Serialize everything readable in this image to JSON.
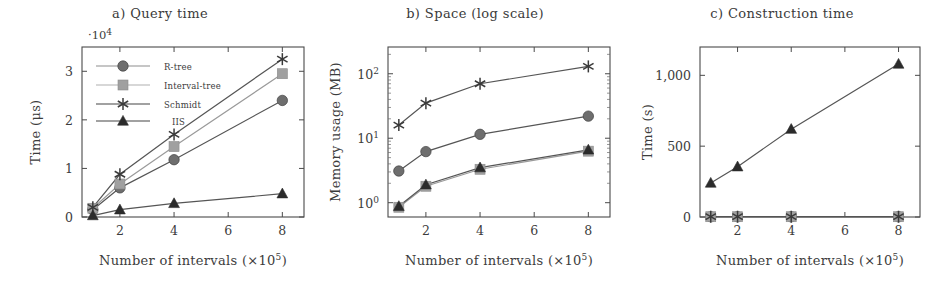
{
  "figure": {
    "panels": [
      "a",
      "b",
      "c"
    ],
    "shared_xlabel": "Number of intervals (×10⁵)",
    "xlabel_main": "Number of intervals (",
    "xlabel_mult": "×10",
    "xlabel_exp": "5",
    "xlabel_close": ")"
  },
  "series_style": {
    "r_tree_color": "#6e6e6e",
    "interval_tree_color": "#a0a0a0",
    "schmidt_color": "#3a3a3a",
    "iis_color": "#2b2b2b",
    "line_color": "#5a5a5a",
    "frame_color": "#4a4a4a",
    "text_color": "#3c3c3c"
  },
  "legend": {
    "entries": [
      {
        "label": "R-tree",
        "marker": "circle"
      },
      {
        "label": "Interval-tree",
        "marker": "square"
      },
      {
        "label": "Schmidt",
        "marker": "star"
      },
      {
        "label": "IIS",
        "marker": "triangle"
      }
    ]
  },
  "chart_data": [
    {
      "panel": "a",
      "type": "line",
      "title": "a) Query time",
      "xlabel": "Number of intervals (×10⁵)",
      "ylabel": "Time (μs)",
      "y_multiplier": "·10⁴",
      "y_mult_base": "·10",
      "y_mult_exp": "4",
      "x": [
        1,
        2,
        4,
        8
      ],
      "xticks": [
        2,
        4,
        6,
        8
      ],
      "xticklabels": [
        "2",
        "4",
        "6",
        "8"
      ],
      "xlim": [
        0.6,
        8.8
      ],
      "yticks": [
        0,
        1,
        2,
        3
      ],
      "yticklabels": [
        "0",
        "1",
        "2",
        "3"
      ],
      "ylim": [
        0,
        3.5
      ],
      "grid": false,
      "legend_position": "upper-left-inside",
      "series": [
        {
          "name": "R-tree",
          "marker": "circle",
          "values": [
            0.15,
            0.6,
            1.18,
            2.4
          ]
        },
        {
          "name": "Interval-tree",
          "marker": "square",
          "values": [
            0.18,
            0.68,
            1.45,
            2.95
          ]
        },
        {
          "name": "Schmidt",
          "marker": "star",
          "values": [
            0.2,
            0.88,
            1.7,
            3.25
          ]
        },
        {
          "name": "IIS",
          "marker": "triangle",
          "values": [
            0.03,
            0.15,
            0.28,
            0.48
          ]
        }
      ]
    },
    {
      "panel": "b",
      "type": "line",
      "title": "b) Space (log scale)",
      "xlabel": "Number of intervals (×10⁵)",
      "ylabel": "Memory usage (MB)",
      "yscale": "log",
      "x": [
        1,
        2,
        4,
        8
      ],
      "xticks": [
        2,
        4,
        6,
        8
      ],
      "xticklabels": [
        "2",
        "4",
        "6",
        "8"
      ],
      "xlim": [
        0.6,
        8.8
      ],
      "yticks": [
        1,
        10,
        100
      ],
      "yticklabels": [
        "10⁰",
        "10¹",
        "10²"
      ],
      "ylim": [
        0.6,
        260
      ],
      "grid": false,
      "legend_position": "none",
      "series": [
        {
          "name": "R-tree",
          "marker": "circle",
          "values": [
            3.1,
            6.2,
            11.5,
            22.0
          ]
        },
        {
          "name": "Interval-tree",
          "marker": "square",
          "values": [
            0.85,
            1.8,
            3.3,
            6.3
          ]
        },
        {
          "name": "Schmidt",
          "marker": "star",
          "values": [
            16.0,
            35.0,
            70.0,
            130.0
          ]
        },
        {
          "name": "IIS",
          "marker": "triangle",
          "values": [
            0.88,
            1.9,
            3.5,
            6.6
          ]
        }
      ]
    },
    {
      "panel": "c",
      "type": "line",
      "title": "c) Construction time",
      "xlabel": "Number of intervals (×10⁵)",
      "ylabel": "Time (s)",
      "x": [
        1,
        2,
        4,
        8
      ],
      "xticks": [
        2,
        4,
        6,
        8
      ],
      "xticklabels": [
        "2",
        "4",
        "6",
        "8"
      ],
      "xlim": [
        0.6,
        8.8
      ],
      "yticks": [
        0,
        500,
        1000
      ],
      "yticklabels": [
        "0",
        "500",
        "1,000"
      ],
      "ylim": [
        0,
        1200
      ],
      "grid": false,
      "legend_position": "none",
      "series": [
        {
          "name": "R-tree",
          "marker": "circle",
          "values": [
            2,
            2,
            2,
            2
          ]
        },
        {
          "name": "Interval-tree",
          "marker": "square",
          "values": [
            2,
            2,
            2,
            2
          ]
        },
        {
          "name": "Schmidt",
          "marker": "star",
          "values": [
            2,
            2,
            2,
            2
          ]
        },
        {
          "name": "IIS",
          "marker": "triangle",
          "values": [
            240,
            355,
            620,
            1080
          ]
        }
      ]
    }
  ]
}
